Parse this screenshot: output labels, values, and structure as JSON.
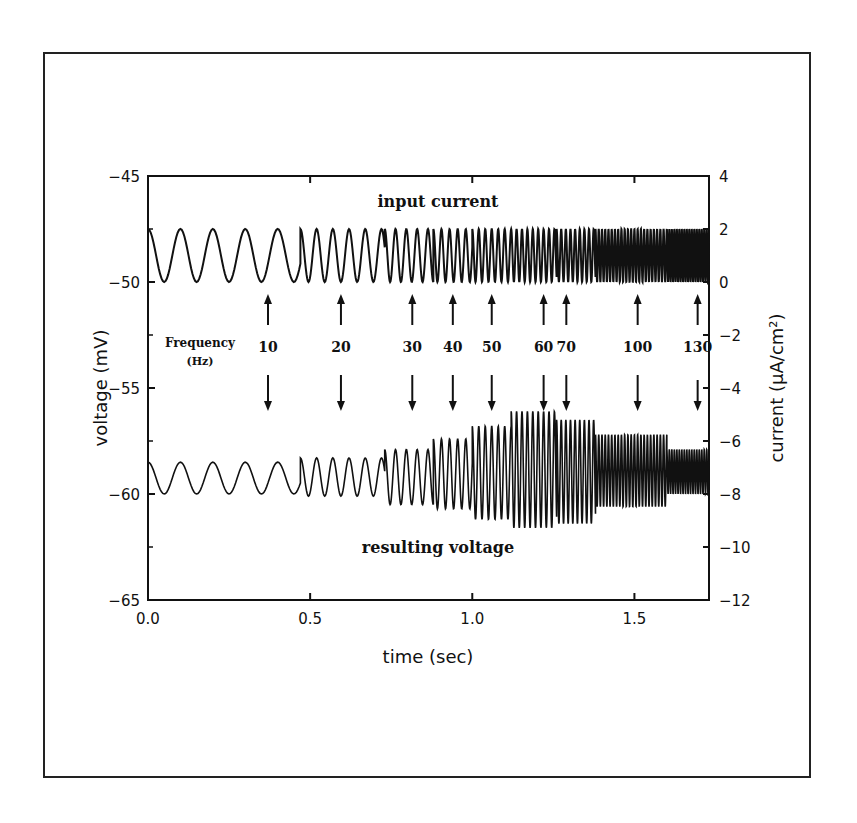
{
  "chart_data": {
    "type": "line",
    "title": "",
    "xlabel": "time (sec)",
    "ylabel_left": "voltage (mV)",
    "ylabel_right": "current (μA/cm²)",
    "xlim": [
      0.0,
      1.73
    ],
    "ylim_left": [
      -65,
      -45
    ],
    "ylim_right": [
      -12,
      4
    ],
    "x_ticks": [
      "0.0",
      "0.5",
      "1.0",
      "1.5"
    ],
    "x_tick_values": [
      0.0,
      0.5,
      1.0,
      1.5
    ],
    "y_left_ticks": [
      "-45",
      "-50",
      "-55",
      "-60",
      "-65"
    ],
    "y_left_tick_values": [
      -45,
      -50,
      -55,
      -60,
      -65
    ],
    "y_right_ticks": [
      "4",
      "2",
      "0",
      "-2",
      "-4",
      "-6",
      "-8",
      "-10",
      "-12"
    ],
    "y_right_tick_values": [
      4,
      2,
      0,
      -2,
      -4,
      -6,
      -8,
      -10,
      -12
    ],
    "grid": false,
    "annotations": {
      "input_label": "input current",
      "output_label": "resulting voltage",
      "frequency_label_line1": "Frequency",
      "frequency_label_line2": "(Hz)"
    },
    "frequency_markers": [
      {
        "freq": "10",
        "time": 0.37
      },
      {
        "freq": "20",
        "time": 0.595
      },
      {
        "freq": "30",
        "time": 0.815
      },
      {
        "freq": "40",
        "time": 0.94
      },
      {
        "freq": "50",
        "time": 1.06
      },
      {
        "freq": "60",
        "time": 1.22
      },
      {
        "freq": "70",
        "time": 1.29
      },
      {
        "freq": "100",
        "time": 1.51
      },
      {
        "freq": "130",
        "time": 1.695
      }
    ],
    "series": [
      {
        "name": "input current",
        "axis": "right",
        "units": "μA/cm²",
        "description": "sinusoidal ZAP current, oscillating between 0 and 2, frequency increasing in steps",
        "min": 0,
        "max": 2,
        "segments": [
          {
            "t_start": 0.0,
            "t_end": 0.47,
            "freq_hz": 10
          },
          {
            "t_start": 0.47,
            "t_end": 0.73,
            "freq_hz": 20
          },
          {
            "t_start": 0.73,
            "t_end": 0.88,
            "freq_hz": 30
          },
          {
            "t_start": 0.88,
            "t_end": 1.0,
            "freq_hz": 40
          },
          {
            "t_start": 1.0,
            "t_end": 1.12,
            "freq_hz": 50
          },
          {
            "t_start": 1.12,
            "t_end": 1.26,
            "freq_hz": 60
          },
          {
            "t_start": 1.26,
            "t_end": 1.38,
            "freq_hz": 70
          },
          {
            "t_start": 1.38,
            "t_end": 1.6,
            "freq_hz": 100
          },
          {
            "t_start": 1.6,
            "t_end": 1.73,
            "freq_hz": 130
          }
        ]
      },
      {
        "name": "resulting voltage",
        "axis": "left",
        "units": "mV",
        "description": "membrane voltage response; amplitude peaks near 60-70 Hz (resonance)",
        "envelope": [
          {
            "freq_hz": 10,
            "max": -58.5,
            "min": -60.0
          },
          {
            "freq_hz": 20,
            "max": -58.3,
            "min": -60.1
          },
          {
            "freq_hz": 30,
            "max": -57.9,
            "min": -60.5
          },
          {
            "freq_hz": 40,
            "max": -57.4,
            "min": -60.7
          },
          {
            "freq_hz": 50,
            "max": -56.8,
            "min": -61.2
          },
          {
            "freq_hz": 60,
            "max": -56.1,
            "min": -61.6
          },
          {
            "freq_hz": 70,
            "max": -56.5,
            "min": -61.4
          },
          {
            "freq_hz": 100,
            "max": -57.2,
            "min": -60.6
          },
          {
            "freq_hz": 130,
            "max": -57.9,
            "min": -60.0
          }
        ]
      }
    ]
  }
}
